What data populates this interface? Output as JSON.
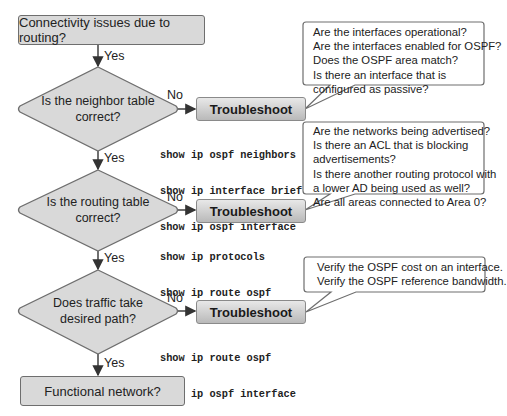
{
  "start": {
    "label": "Connectivity issues due to routing?"
  },
  "end": {
    "label": "Functional network?"
  },
  "decisions": [
    {
      "line1": "Is the neighbor table",
      "line2": "correct?",
      "no_label": "No",
      "yes_label": "Yes",
      "action_label": "Troubleshoot",
      "commands": [
        "show ip ospf neighbors",
        "show ip interface brief",
        "show ip ospf interface"
      ],
      "callout": [
        "Are the interfaces operational?",
        "Are the interfaces enabled for OSPF?",
        "Does the OSPF area match?",
        "Is there an interface that is",
        "configured as passive?"
      ]
    },
    {
      "line1": "Is the routing table",
      "line2": "correct?",
      "no_label": "No",
      "yes_label": "Yes",
      "action_label": "Troubleshoot",
      "commands": [
        "show ip protocols",
        "show ip route ospf"
      ],
      "callout": [
        "Are the networks being advertised?",
        "Is there an ACL that is blocking",
        "advertisements?",
        "Is there another routing protocol with",
        "a lower AD being used as well?",
        "Are all areas connected to Area 0?"
      ]
    },
    {
      "line1": "Does traffic take",
      "line2": "desired path?",
      "no_label": "No",
      "yes_label": "Yes",
      "action_label": "Troubleshoot",
      "commands": [
        "show ip route ospf",
        "show ip ospf interface"
      ],
      "callout": [
        "Verify the OSPF cost on an interface.",
        "Verify the OSPF reference bandwidth."
      ]
    }
  ],
  "start_yes_label": "Yes",
  "colors": {
    "shape_fill": "#d9d9d9",
    "stroke": "#6e6e6e",
    "arrow": "#333333"
  }
}
